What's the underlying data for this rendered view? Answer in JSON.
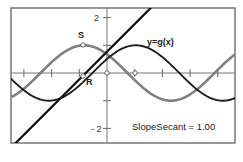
{
  "chart_data": {
    "type": "line",
    "title": "",
    "xlabel": "",
    "ylabel": "",
    "xlim": [
      -3.5,
      4.6
    ],
    "ylim": [
      -2.54,
      2.35
    ],
    "grid": false,
    "y_tick_labels": [
      {
        "value": 2,
        "label": "2"
      },
      {
        "value": -2,
        "label": "- 2"
      }
    ],
    "x_ticks": [
      -3,
      -2,
      -1,
      0,
      1,
      2,
      3,
      4
    ],
    "y_ticks": [
      -2,
      -1,
      1,
      2
    ],
    "series": [
      {
        "name": "gray-curve",
        "description": "sinusoid with peak near x=-0.87 (point S)",
        "formula": "sin(x + 2.4)",
        "color": "#808080"
      },
      {
        "name": "y=g(x)",
        "description": "sinusoid with peak near x=1.0",
        "formula": "cos(x - 1.04)",
        "color": "#1e1e1e"
      },
      {
        "name": "secant-line",
        "description": "secant line through R with slope 1",
        "formula": "x + 0.77",
        "slope": 1.0,
        "color": "#111111"
      }
    ],
    "points": [
      {
        "label": "S",
        "x": -0.87,
        "y": 1.0
      },
      {
        "label": "R",
        "x": -0.87,
        "y": -0.1
      },
      {
        "label": "",
        "x": 0,
        "y": 0
      },
      {
        "label": "",
        "x": 1.0,
        "y": 0
      }
    ],
    "annotations": [
      {
        "text": "y=g(x)",
        "x": 1.45,
        "y": 1.1
      },
      {
        "text": "SlopeSecant = 1.00",
        "x": 0.9,
        "y": -2.05
      }
    ]
  },
  "labels": {
    "curve_label": "y=g(x)",
    "point_s": "S",
    "point_r": "R",
    "y_tick_2": "2",
    "y_tick_neg2": "- 2",
    "readout": "SlopeSecant = 1.00"
  }
}
